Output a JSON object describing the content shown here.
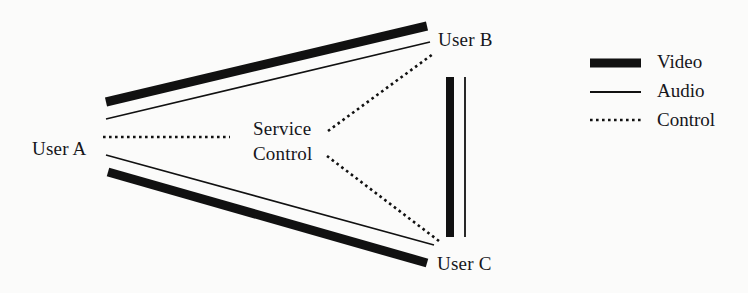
{
  "figure": {
    "type": "network-topology-diagram"
  },
  "nodes": [
    {
      "id": "user-a",
      "label": "User A"
    },
    {
      "id": "user-b",
      "label": "User B"
    },
    {
      "id": "user-c",
      "label": "User C"
    },
    {
      "id": "service-control",
      "label_line1": "Service",
      "label_line2": "Control"
    }
  ],
  "legend": {
    "items": [
      {
        "key": "video",
        "label": "Video",
        "style": "thick-solid",
        "color": "#111111"
      },
      {
        "key": "audio",
        "label": "Audio",
        "style": "thin-solid",
        "color": "#111111"
      },
      {
        "key": "control",
        "label": "Control",
        "style": "dotted",
        "color": "#111111"
      }
    ]
  },
  "links": [
    {
      "from": "user-a",
      "to": "user-b",
      "type": "video"
    },
    {
      "from": "user-a",
      "to": "user-b",
      "type": "audio"
    },
    {
      "from": "user-a",
      "to": "user-c",
      "type": "video"
    },
    {
      "from": "user-a",
      "to": "user-c",
      "type": "audio"
    },
    {
      "from": "user-a",
      "to": "service-control",
      "type": "control"
    },
    {
      "from": "service-control",
      "to": "user-b",
      "type": "control"
    },
    {
      "from": "service-control",
      "to": "user-c",
      "type": "control"
    },
    {
      "from": "user-b",
      "to": "user-c",
      "type": "video"
    },
    {
      "from": "user-b",
      "to": "user-c",
      "type": "audio"
    }
  ],
  "colors": {
    "stroke": "#111111",
    "background": "#fbfbfa"
  }
}
